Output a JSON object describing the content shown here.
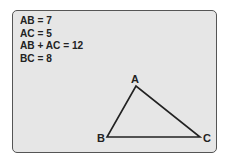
{
  "equations": [
    "AB = 7",
    "AC = 5",
    "AB + AC = 12",
    "BC = 8"
  ],
  "triangle": {
    "vertices": [
      {
        "label": "A",
        "x": 136,
        "y": 86,
        "lx": 131,
        "ly": 83
      },
      {
        "label": "B",
        "x": 107,
        "y": 137,
        "lx": 97,
        "ly": 142
      },
      {
        "label": "C",
        "x": 200,
        "y": 137,
        "lx": 203,
        "ly": 142
      }
    ]
  },
  "colors": {
    "panel": "#e6e6e6",
    "line": "#222222"
  }
}
